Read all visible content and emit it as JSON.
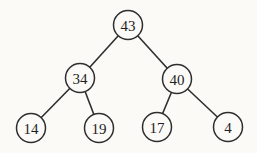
{
  "diagram": {
    "type": "binary-tree",
    "background_color": "#fbfaf7",
    "stroke_color": "#2e2e2e",
    "text_color": "#1f1f1f",
    "node_radius": 14.5,
    "font_size": 15,
    "nodes": [
      {
        "id": "root",
        "label": "43",
        "x": 128,
        "y": 25
      },
      {
        "id": "l",
        "label": "34",
        "x": 80,
        "y": 78
      },
      {
        "id": "r",
        "label": "40",
        "x": 177,
        "y": 79
      },
      {
        "id": "ll",
        "label": "14",
        "x": 31,
        "y": 128
      },
      {
        "id": "lr",
        "label": "19",
        "x": 99,
        "y": 128
      },
      {
        "id": "rl",
        "label": "17",
        "x": 157,
        "y": 127
      },
      {
        "id": "rr",
        "label": "4",
        "x": 228,
        "y": 127
      }
    ],
    "edges": [
      {
        "from": "root",
        "to": "l"
      },
      {
        "from": "root",
        "to": "r"
      },
      {
        "from": "l",
        "to": "ll"
      },
      {
        "from": "l",
        "to": "lr"
      },
      {
        "from": "r",
        "to": "rl"
      },
      {
        "from": "r",
        "to": "rr"
      }
    ]
  }
}
